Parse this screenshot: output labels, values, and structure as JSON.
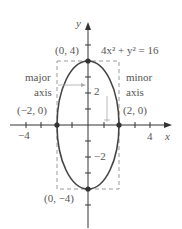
{
  "figure": {
    "equation": "4x² + y² = 16",
    "axis_labels": {
      "x": "x",
      "y": "y"
    },
    "tick_labels": {
      "x_neg": "−4",
      "x_pos": "4",
      "y_pos": "2",
      "y_neg": "−2"
    },
    "points": {
      "top": "(0, 4)",
      "bottom": "(0, −4)",
      "left": "(−2, 0)",
      "right": "(2, 0)"
    },
    "annotations": {
      "major_line1": "major",
      "major_line2": "axis",
      "minor_line1": "minor",
      "minor_line2": "axis"
    },
    "colors": {
      "curve": "#444444",
      "axes": "#333333",
      "dashed_box": "#999999",
      "text": "#555555",
      "pointer": "#aaaaaa"
    }
  }
}
